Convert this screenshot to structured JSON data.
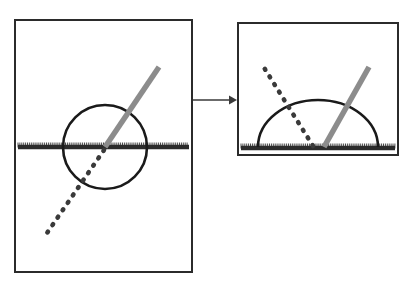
{
  "figure": {
    "background_color": "#ffffff",
    "width": 420,
    "height": 286
  },
  "style": {
    "frame_color": "#2b2b2b",
    "frame_width": 2,
    "curve_color": "#1a1a1a",
    "curve_width": 2.6,
    "ray_gray_color": "#8c8c8c",
    "ray_gray_width": 5.5,
    "ray_dotted_color": "#3a3a3a",
    "ray_dotted_width": 4.6,
    "ray_dotted_dash": "1 8",
    "boundary_color": "#2b2b2b",
    "boundary_width": 4.5,
    "hatch_color": "#4a4a4a",
    "hatch_width": 1,
    "arrow_color": "#3a3a3a",
    "arrow_width": 1.6
  },
  "panels": [
    {
      "id": "left-panel",
      "name": "full-circle-panel",
      "frame": {
        "x": 15,
        "y": 20,
        "width": 177,
        "height": 252
      },
      "boundary_line": {
        "name": "hatched-boundary-line",
        "x1": 18,
        "x2": 189,
        "y": 147,
        "hatch_spacing": 1.9,
        "hatch_height": 4
      },
      "circle": {
        "name": "full-circle",
        "cx": 105,
        "cy": 147,
        "r": 42
      },
      "gray_ray": {
        "name": "gray-ray",
        "x1": 105,
        "y1": 147,
        "x2": 159,
        "y2": 67
      },
      "dotted_ray": {
        "name": "dotted-ray",
        "x1": 104,
        "y1": 150,
        "x2": 47,
        "y2": 233
      }
    },
    {
      "id": "right-panel",
      "name": "half-disc-panel",
      "frame": {
        "x": 238,
        "y": 23,
        "width": 160,
        "height": 132
      },
      "boundary_line": {
        "name": "hatched-boundary-line",
        "x1": 241,
        "x2": 395,
        "y": 148,
        "hatch_spacing": 1.9,
        "hatch_height": 4
      },
      "semicircle": {
        "name": "upper-semicircle",
        "cx": 318,
        "cy": 147,
        "r": 60,
        "ry": 47,
        "start_x": 258,
        "end_x": 378
      },
      "gray_ray": {
        "name": "gray-ray",
        "x1": 324,
        "y1": 147,
        "x2": 369,
        "y2": 67
      },
      "dotted_ray": {
        "name": "dotted-ray",
        "x1": 313,
        "y1": 146,
        "x2": 263,
        "y2": 66
      }
    }
  ],
  "arrow": {
    "name": "transformation-arrow",
    "x1": 193,
    "y1": 100,
    "x2": 237,
    "y2": 100,
    "head_width": 9,
    "head_height": 8
  }
}
